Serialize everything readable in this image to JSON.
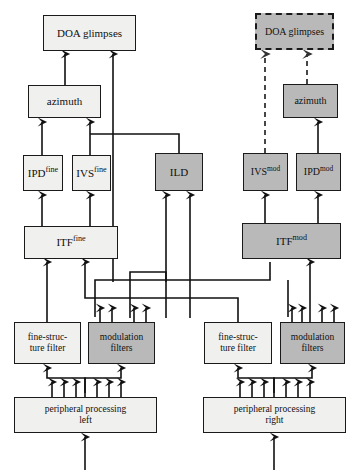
{
  "diagram": {
    "colors": {
      "light_fill": "#f0f0ee",
      "gray_fill": "#b9b9b9",
      "stroke": "#1a1a1a",
      "background": "#ffffff"
    },
    "nodes": [
      {
        "id": "doa_left",
        "label": "DOA glimpses",
        "sup": "",
        "fill": "light",
        "border": "solid",
        "x": 43,
        "y": 15,
        "w": 93,
        "h": 36,
        "font": 11
      },
      {
        "id": "doa_right",
        "label": "DOA glimpses",
        "sup": "",
        "fill": "gray",
        "border": "dashed",
        "x": 255,
        "y": 13,
        "w": 79,
        "h": 37,
        "font": 10
      },
      {
        "id": "azimuth_left",
        "label": "azimuth",
        "sup": "",
        "fill": "light",
        "border": "solid",
        "x": 28,
        "y": 85,
        "w": 73,
        "h": 33,
        "font": 11
      },
      {
        "id": "azimuth_right",
        "label": "azimuth",
        "sup": "",
        "fill": "gray",
        "border": "solid",
        "x": 283,
        "y": 84,
        "w": 55,
        "h": 34,
        "font": 10
      },
      {
        "id": "ipd_fine",
        "label": "IPD",
        "sup": "fine",
        "fill": "light",
        "border": "solid",
        "x": 23,
        "y": 155,
        "w": 40,
        "h": 36,
        "font": 11
      },
      {
        "id": "ivs_fine",
        "label": "IVS",
        "sup": "fine",
        "fill": "light",
        "border": "solid",
        "x": 72,
        "y": 155,
        "w": 39,
        "h": 36,
        "font": 11
      },
      {
        "id": "ild",
        "label": "ILD",
        "sup": "",
        "fill": "gray",
        "border": "solid",
        "x": 155,
        "y": 153,
        "w": 48,
        "h": 38,
        "font": 11
      },
      {
        "id": "ivs_mod",
        "label": "IVS",
        "sup": "mod",
        "fill": "gray",
        "border": "solid",
        "x": 243,
        "y": 153,
        "w": 45,
        "h": 38,
        "font": 10
      },
      {
        "id": "ipd_mod",
        "label": "IPD",
        "sup": "mod",
        "fill": "gray",
        "border": "solid",
        "x": 296,
        "y": 153,
        "w": 45,
        "h": 38,
        "font": 10
      },
      {
        "id": "itf_fine",
        "label": "ITF",
        "sup": "fine",
        "fill": "light",
        "border": "solid",
        "x": 24,
        "y": 226,
        "w": 94,
        "h": 33,
        "font": 11
      },
      {
        "id": "itf_mod",
        "label": "ITF",
        "sup": "mod",
        "fill": "gray",
        "border": "solid",
        "x": 242,
        "y": 223,
        "w": 99,
        "h": 36,
        "font": 11
      },
      {
        "id": "fine_filter_left",
        "label": "fine-struc-\nture filter",
        "sup": "",
        "fill": "light",
        "border": "solid",
        "x": 14,
        "y": 322,
        "w": 67,
        "h": 42,
        "font": 9.5
      },
      {
        "id": "mod_filter_left",
        "label": "modulation\nfilters",
        "sup": "",
        "fill": "gray",
        "border": "solid",
        "x": 88,
        "y": 322,
        "w": 67,
        "h": 42,
        "font": 9.5
      },
      {
        "id": "fine_filter_right",
        "label": "fine-struc-\nture filter",
        "sup": "",
        "fill": "light",
        "border": "solid",
        "x": 204,
        "y": 322,
        "w": 68,
        "h": 42,
        "font": 9.5
      },
      {
        "id": "mod_filter_right",
        "label": "modulation\nfilters",
        "sup": "",
        "fill": "gray",
        "border": "solid",
        "x": 280,
        "y": 322,
        "w": 65,
        "h": 42,
        "font": 9.5
      },
      {
        "id": "periph_left",
        "label": "peripheral processing\nleft",
        "sup": "",
        "fill": "light",
        "border": "solid",
        "x": 14,
        "y": 397,
        "w": 143,
        "h": 36,
        "font": 9.5
      },
      {
        "id": "periph_right",
        "label": "peripheral processing\nright",
        "sup": "",
        "fill": "light",
        "border": "solid",
        "x": 203,
        "y": 397,
        "w": 143,
        "h": 36,
        "font": 9.5
      }
    ],
    "edge_groups": [
      {
        "name": "azimuth-left-to-doa-left",
        "style": "solid"
      },
      {
        "name": "ild-to-doa-left",
        "style": "solid"
      },
      {
        "name": "ipd-fine-to-azimuth-left",
        "style": "solid"
      },
      {
        "name": "ivs-fine-to-azimuth-left",
        "style": "solid"
      },
      {
        "name": "ild-to-azimuth-left",
        "style": "solid"
      },
      {
        "name": "itf-fine-to-ipd-fine",
        "style": "solid"
      },
      {
        "name": "itf-fine-to-ivs-fine",
        "style": "solid"
      },
      {
        "name": "azimuth-right-to-doa-right",
        "style": "dashed"
      },
      {
        "name": "ivs-mod-to-doa-right",
        "style": "dashed"
      },
      {
        "name": "itf-mod-to-ivs-mod",
        "style": "solid"
      },
      {
        "name": "itf-mod-to-ipd-mod",
        "style": "solid"
      },
      {
        "name": "ipd-mod-to-azimuth-right",
        "style": "solid"
      },
      {
        "name": "filters-to-itf",
        "style": "solid"
      },
      {
        "name": "filters-to-ild",
        "style": "solid"
      },
      {
        "name": "periph-to-filters",
        "style": "solid"
      },
      {
        "name": "input-to-periph",
        "style": "solid"
      }
    ]
  }
}
